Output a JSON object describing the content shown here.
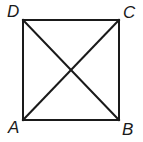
{
  "figure": {
    "name": "square-with-diagonals",
    "background_color": "#ffffff",
    "stroke_color": "#1a1a1a",
    "stroke_width": 2,
    "label_color": "#1a1a1a",
    "square": {
      "top_left": {
        "x": 23,
        "y": 20
      },
      "top_right": {
        "x": 119,
        "y": 20
      },
      "bottom_right": {
        "x": 119,
        "y": 120
      },
      "bottom_left": {
        "x": 23,
        "y": 120
      }
    },
    "diagonals": [
      {
        "name": "diagonal-D-to-B",
        "from": "D",
        "to": "B"
      },
      {
        "name": "diagonal-A-to-C",
        "from": "A",
        "to": "C"
      }
    ],
    "intersection": {
      "x": 71,
      "y": 70
    },
    "vertices": [
      {
        "id": "D",
        "label": "D",
        "position": "top-left"
      },
      {
        "id": "C",
        "label": "C",
        "position": "top-right"
      },
      {
        "id": "A",
        "label": "A",
        "position": "bottom-left"
      },
      {
        "id": "B",
        "label": "B",
        "position": "bottom-right"
      }
    ]
  }
}
